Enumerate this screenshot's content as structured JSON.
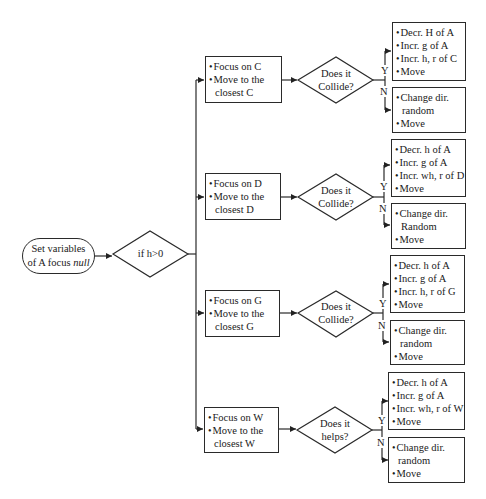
{
  "start": {
    "line1": "Set variables",
    "line2_prefix": "of A focus ",
    "line2_italic": "null"
  },
  "condition": {
    "label": "if h>0"
  },
  "branches": [
    {
      "target": "C",
      "focus": {
        "item1": "Focus on C",
        "item2": "Move to the",
        "item2_cont": "closest C"
      },
      "decision": {
        "line1": "Does it",
        "line2": "Collide?"
      },
      "yes_label": "Y",
      "no_label": "N",
      "yes_actions": [
        "Decr. H of A",
        "Incr. g of A",
        "Incr. h, r of C",
        "Move"
      ],
      "no_actions": {
        "item1": "Change dir.",
        "item1_cont": "random",
        "item2": "Move"
      }
    },
    {
      "target": "D",
      "focus": {
        "item1": "Focus on D",
        "item2": "Move to the",
        "item2_cont": "closest D"
      },
      "decision": {
        "line1": "Does it",
        "line2": "Collide?"
      },
      "yes_label": "Y",
      "no_label": "N",
      "yes_actions": [
        "Decr. h of A",
        "Incr. g of A",
        "Incr. wh, r of D",
        "Move"
      ],
      "no_actions": {
        "item1": "Change dir.",
        "item1_cont": "Random",
        "item2": "Move"
      }
    },
    {
      "target": "G",
      "focus": {
        "item1": "Focus on G",
        "item2": "Move to the",
        "item2_cont": "closest G"
      },
      "decision": {
        "line1": "Does it",
        "line2": "Collide?"
      },
      "yes_label": "Y",
      "no_label": "N",
      "yes_actions": [
        "Decr. h of A",
        "Incr. g of A",
        "Incr. h, r of G",
        "Move"
      ],
      "no_actions": {
        "item1": "Change dir.",
        "item1_cont": "random",
        "item2": "Move"
      }
    },
    {
      "target": "W",
      "focus": {
        "item1": "Focus on W",
        "item2": "Move to the",
        "item2_cont": "closest W"
      },
      "decision": {
        "line1": "Does it",
        "line2": "helps?"
      },
      "yes_label": "Y",
      "no_label": "N",
      "yes_actions": [
        "Decr. h of A",
        "Incr. g of A",
        "Incr. wh, r of W",
        "Move"
      ],
      "no_actions": {
        "item1": "Change dir.",
        "item1_cont": "random",
        "item2": "Move"
      }
    }
  ]
}
